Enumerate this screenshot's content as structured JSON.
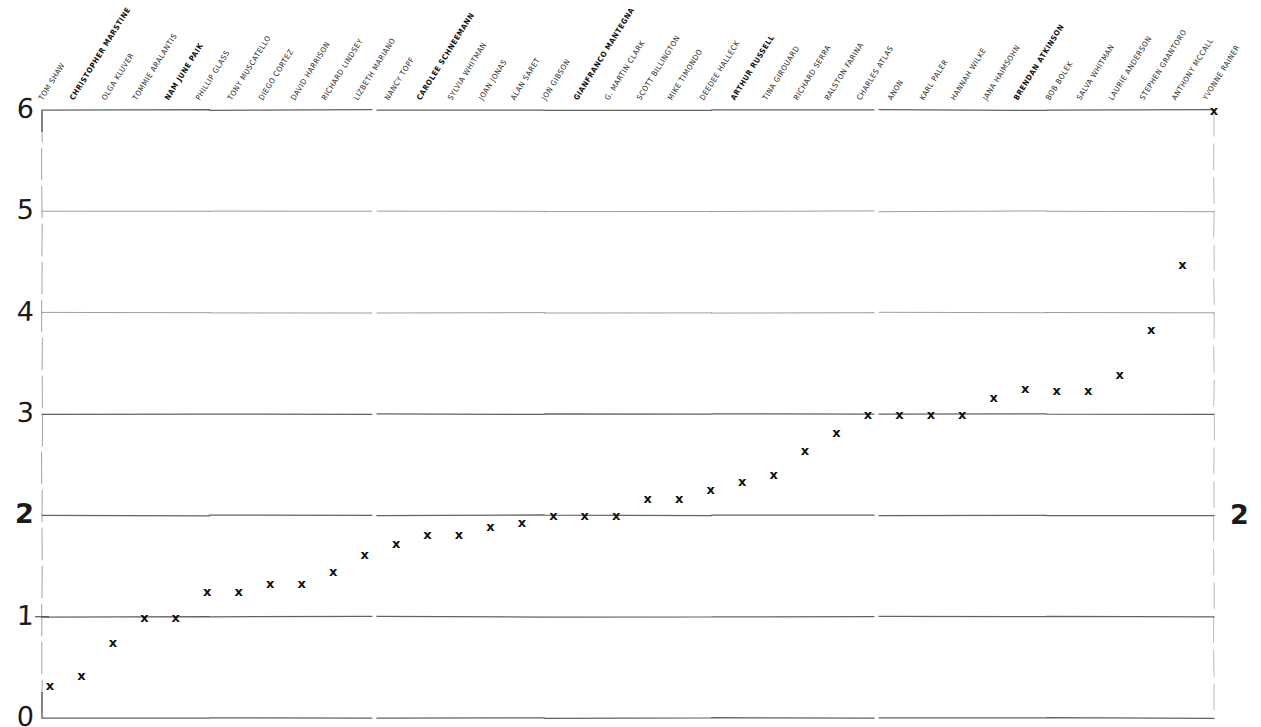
{
  "chart_data": {
    "type": "scatter",
    "title": "",
    "subtitle": "",
    "xlabel": "",
    "ylabel": "",
    "ylim": [
      0,
      6
    ],
    "xlim": [
      0,
      38
    ],
    "grid": true,
    "gridlines_y": [
      0,
      1,
      2,
      3,
      4,
      5,
      6
    ],
    "legend": "none",
    "y_tick_labels": [
      "0",
      "1",
      "2",
      "3",
      "4",
      "5",
      "6"
    ],
    "y_tick_values": [
      0,
      1,
      2,
      3,
      4,
      5,
      6
    ],
    "y_axis_right_labels": [
      "2"
    ],
    "emphasized_tick": "2",
    "marker_symbol": "x",
    "marker_color": "#111111",
    "axis_color": "#555555",
    "background_color": "#ffffff",
    "categories": [
      "TOM SHAW",
      "CHRISTOPHER MARSTINE",
      "OLGA KLUVER",
      "TOMMIE ARALANTIS",
      "NAM JUNE PAIK",
      "PHILLIP GLASS",
      "TONY MUSCATELLO",
      "DIEGO CORTEZ",
      "DAVID HARRISON",
      "RICHARD LINDSEY",
      "LIZBETH MARIANO",
      "NANCY TOPF",
      "CAROLEE SCHNEEMANN",
      "SYLVIA WHITMAN",
      "JOAN JONAS",
      "ALAN SARET",
      "JON GIBSON",
      "GIANFRANCO MANTEGNA",
      "G. MARTIN CLARK",
      "SCOTT BILLINGTON",
      "MIKE TIMONDO",
      "DEEDEE HALLECK",
      "ARTHUR RUSSELL",
      "TINA GIROUARD",
      "RICHARD SERRA",
      "RALSTON FARINA",
      "CHARLES ATLAS",
      "ANON",
      "KARL PALER",
      "HANNAH WILKE",
      "JANA HAIMSOHN",
      "BRENDAN ATKINSON",
      "BOB BOLEK",
      "SALVA WHITMAN",
      "LAURIE ANDERSON",
      "STEPHEN GRANTORO",
      "ANTHONY MCCALL",
      "YVONNE RAINER"
    ],
    "bold_categories": [
      "CHRISTOPHER MARSTINE",
      "NAM JUNE PAIK",
      "CAROLEE SCHNEEMANN",
      "GIANFRANCO MANTEGNA",
      "ARTHUR RUSSELL",
      "BRENDAN ATKINSON"
    ],
    "values": [
      0.33,
      0.42,
      0.75,
      1.0,
      1.0,
      1.25,
      1.25,
      1.33,
      1.33,
      1.45,
      1.62,
      1.73,
      1.82,
      1.82,
      1.9,
      1.93,
      2.0,
      2.0,
      2.0,
      2.17,
      2.17,
      2.26,
      2.34,
      2.41,
      2.65,
      2.82,
      3.0,
      3.0,
      3.0,
      3.0,
      3.17,
      3.26,
      3.24,
      3.24,
      3.4,
      3.84,
      4.48,
      6.0
    ],
    "points": [
      {
        "label": "TOM SHAW",
        "value": 0.33
      },
      {
        "label": "CHRISTOPHER MARSTINE",
        "value": 0.42
      },
      {
        "label": "OLGA KLUVER",
        "value": 0.75
      },
      {
        "label": "TOMMIE ARALANTIS",
        "value": 1.0
      },
      {
        "label": "NAM JUNE PAIK",
        "value": 1.0
      },
      {
        "label": "PHILLIP GLASS",
        "value": 1.25
      },
      {
        "label": "TONY MUSCATELLO",
        "value": 1.25
      },
      {
        "label": "DIEGO CORTEZ",
        "value": 1.33
      },
      {
        "label": "DAVID HARRISON",
        "value": 1.33
      },
      {
        "label": "RICHARD LINDSEY",
        "value": 1.45
      },
      {
        "label": "LIZBETH MARIANO",
        "value": 1.62
      },
      {
        "label": "NANCY TOPF",
        "value": 1.73
      },
      {
        "label": "CAROLEE SCHNEEMANN",
        "value": 1.82
      },
      {
        "label": "SYLVIA WHITMAN",
        "value": 1.82
      },
      {
        "label": "JOAN JONAS",
        "value": 1.9
      },
      {
        "label": "ALAN SARET",
        "value": 1.93
      },
      {
        "label": "JON GIBSON",
        "value": 2.0
      },
      {
        "label": "GIANFRANCO MANTEGNA",
        "value": 2.0
      },
      {
        "label": "G. MARTIN CLARK",
        "value": 2.0
      },
      {
        "label": "SCOTT BILLINGTON",
        "value": 2.17
      },
      {
        "label": "MIKE TIMONDO",
        "value": 2.17
      },
      {
        "label": "DEEDEE HALLECK",
        "value": 2.26
      },
      {
        "label": "ARTHUR RUSSELL",
        "value": 2.34
      },
      {
        "label": "TINA GIROUARD",
        "value": 2.41
      },
      {
        "label": "RICHARD SERRA",
        "value": 2.65
      },
      {
        "label": "RALSTON FARINA",
        "value": 2.82
      },
      {
        "label": "CHARLES ATLAS",
        "value": 3.0
      },
      {
        "label": "ANON",
        "value": 3.0
      },
      {
        "label": "KARL PALER",
        "value": 3.0
      },
      {
        "label": "HANNAH WILKE",
        "value": 3.0
      },
      {
        "label": "JANA HAIMSOHN",
        "value": 3.17
      },
      {
        "label": "BRENDAN ATKINSON",
        "value": 3.26
      },
      {
        "label": "BOB BOLEK",
        "value": 3.24
      },
      {
        "label": "SALVA WHITMAN",
        "value": 3.24
      },
      {
        "label": "LAURIE ANDERSON",
        "value": 3.4
      },
      {
        "label": "STEPHEN GRANTORO",
        "value": 3.84
      },
      {
        "label": "ANTHONY MCCALL",
        "value": 4.48
      },
      {
        "label": "YVONNE RAINER",
        "value": 6.0
      }
    ]
  }
}
